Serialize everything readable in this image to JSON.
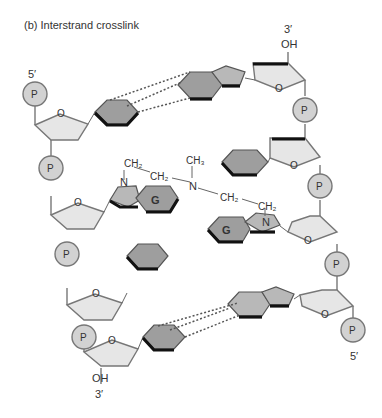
{
  "figure": {
    "title": "(b)  Interstrand crosslink",
    "left_strand": {
      "top_end": "5′",
      "bottom_end": "3′",
      "bottom_group": "OH",
      "phosphates": [
        "P",
        "P",
        "P",
        "P"
      ]
    },
    "right_strand": {
      "top_end": "3′",
      "top_group": "OH",
      "bottom_end": "5′",
      "phosphates": [
        "P",
        "P",
        "P",
        "P"
      ]
    },
    "sugar_oxygen": "O",
    "crosslinked_base": "G",
    "crosslinker": {
      "left_N": "N",
      "right_N": "N",
      "center_N": "N",
      "ch2_a": "CH₂",
      "ch2_b": "CH₂",
      "ch3": "CH₃",
      "ch2_c": "CH₂",
      "ch2_d": "CH₂"
    }
  }
}
